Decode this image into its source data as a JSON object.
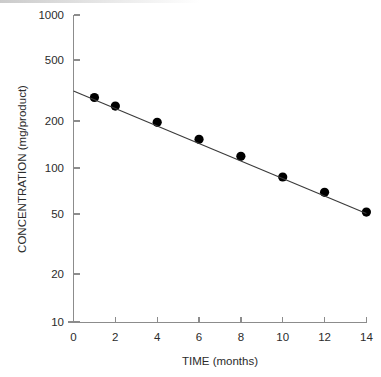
{
  "figure": {
    "background_color": "#ffffff",
    "width": 381,
    "height": 377
  },
  "chart_data": {
    "type": "scatter",
    "title": "",
    "subtitle": "",
    "xlabel": "TIME (months)",
    "ylabel": "CONCENTRATION (mg/product)",
    "x": [
      1,
      2,
      4,
      6,
      8,
      10,
      12,
      14
    ],
    "values": [
      290,
      255,
      200,
      155,
      120,
      88,
      70,
      52
    ],
    "series": [
      {
        "name": "Concentration",
        "x": [
          1,
          2,
          4,
          6,
          8,
          10,
          12,
          14
        ],
        "values": [
          290,
          255,
          200,
          155,
          120,
          88,
          70,
          52
        ],
        "marker": "filled-circle",
        "marker_color": "#000000"
      },
      {
        "name": "Fitted regression line",
        "x": [
          0,
          14
        ],
        "values": [
          320,
          51
        ],
        "line_color": "#3a3a3a",
        "marker": "none"
      }
    ],
    "xscale": "linear",
    "yscale": "log",
    "xlim": [
      0,
      14
    ],
    "ylim": [
      10,
      1000
    ],
    "xticks": [
      0,
      2,
      4,
      6,
      8,
      10,
      12,
      14
    ],
    "xtick_labels": [
      "0",
      "2",
      "4",
      "6",
      "8",
      "10",
      "12",
      "14"
    ],
    "yticks": [
      10,
      20,
      50,
      100,
      200,
      500,
      1000
    ],
    "ytick_labels": [
      "10",
      "20",
      "50",
      "100",
      "200",
      "500",
      "1000"
    ],
    "grid": false,
    "legend": null,
    "legend_position": "none",
    "annotations": [],
    "axis_color": "#8c8c8c",
    "spines": [
      "left",
      "bottom"
    ]
  },
  "axes": {
    "x_title": "TIME (months)",
    "y_title": "CONCENTRATION (mg/product)"
  },
  "ticks": {
    "y": [
      {
        "label": "1000",
        "value": 1000
      },
      {
        "label": "500",
        "value": 500
      },
      {
        "label": "200",
        "value": 200
      },
      {
        "label": "100",
        "value": 100
      },
      {
        "label": "50",
        "value": 50
      },
      {
        "label": "20",
        "value": 20
      },
      {
        "label": "10",
        "value": 10
      }
    ],
    "x": [
      {
        "label": "0",
        "value": 0
      },
      {
        "label": "2",
        "value": 2
      },
      {
        "label": "4",
        "value": 4
      },
      {
        "label": "6",
        "value": 6
      },
      {
        "label": "8",
        "value": 8
      },
      {
        "label": "10",
        "value": 10
      },
      {
        "label": "12",
        "value": 12
      },
      {
        "label": "14",
        "value": 14
      }
    ]
  }
}
